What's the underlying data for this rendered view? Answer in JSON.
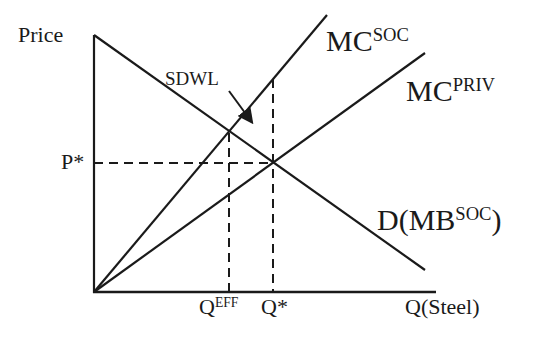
{
  "diagram": {
    "colors": {
      "line": "#1a1a1a",
      "background": "#ffffff"
    },
    "axes": {
      "y_label": "Price",
      "x_label": "Q(Steel)"
    },
    "curves": {
      "mc_soc": {
        "base": "MC",
        "sup": "SOC"
      },
      "mc_priv": {
        "base": "MC",
        "sup": "PRIV"
      },
      "demand": {
        "prefix": "D(MB",
        "sup": "SOC",
        "suffix": ")"
      }
    },
    "markers": {
      "p_star": "P*",
      "q_star": "Q*",
      "q_eff": {
        "base": "Q",
        "sup": "EFF"
      }
    },
    "annotations": {
      "sdwl": "SDWL"
    }
  }
}
